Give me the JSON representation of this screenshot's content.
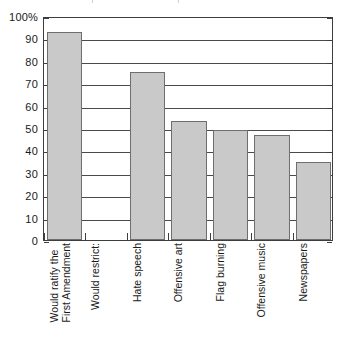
{
  "chart_data": {
    "type": "bar",
    "title": "",
    "subtitle": "",
    "xlabel": "",
    "ylabel": "",
    "ylim": [
      0,
      100
    ],
    "ytick_values": [
      0,
      10,
      20,
      30,
      40,
      50,
      60,
      70,
      80,
      90,
      100
    ],
    "ytick_labels": [
      "0",
      "10",
      "20",
      "30",
      "40",
      "50",
      "60",
      "70",
      "80",
      "90",
      "100%"
    ],
    "grid": true,
    "grid_axis": "y",
    "legend": false,
    "legend_position": "none",
    "categories": [
      "Would ratify the First Amendment",
      "Would restrict:",
      "Hate speech",
      "Offensive art",
      "Flag burning",
      "Offensive music",
      "Newspapers"
    ],
    "category_lines": [
      [
        "Would ratify the",
        "First Amendment"
      ],
      [
        "Would restrict:"
      ],
      [
        "Hate speech"
      ],
      [
        "Offensive art"
      ],
      [
        "Flag burning"
      ],
      [
        "Offensive music"
      ],
      [
        "Newspapers"
      ]
    ],
    "values": [
      93,
      null,
      75,
      53,
      49,
      47,
      35
    ],
    "bar_color": "#c9c9c9",
    "bar_edge_color": "#6e6e6e",
    "axis_color": "#3d3d3d",
    "gridline_color": "#4a4a4a",
    "background_color": "#ffffff"
  },
  "axis": {
    "y_labels": [
      {
        "text": "100%",
        "value": 100
      },
      {
        "text": "90",
        "value": 90
      },
      {
        "text": "80",
        "value": 80
      },
      {
        "text": "70",
        "value": 70
      },
      {
        "text": "60",
        "value": 60
      },
      {
        "text": "50",
        "value": 50
      },
      {
        "text": "40",
        "value": 40
      },
      {
        "text": "30",
        "value": 30
      },
      {
        "text": "20",
        "value": 20
      },
      {
        "text": "10",
        "value": 10
      },
      {
        "text": "0",
        "value": 0
      }
    ]
  }
}
